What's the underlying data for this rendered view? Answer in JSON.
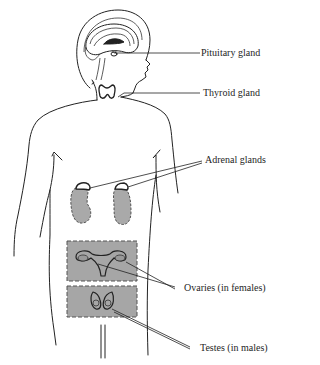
{
  "diagram": {
    "colors": {
      "outline": "#222222",
      "organ_fill": "#a9a9a9",
      "region_box_fill": "#a6a6a6",
      "background": "#ffffff"
    },
    "labels": [
      {
        "id": "pituitary",
        "text": "Pituitary gland"
      },
      {
        "id": "thyroid",
        "text": "Thyroid gland"
      },
      {
        "id": "adrenal",
        "text": "Adrenal glands"
      },
      {
        "id": "ovaries",
        "text": "Ovaries (in females)"
      },
      {
        "id": "testes",
        "text": "Testes (in males)"
      }
    ]
  }
}
